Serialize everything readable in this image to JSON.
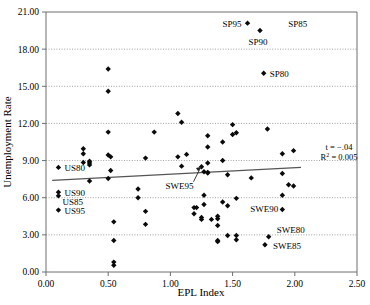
{
  "chart_data": {
    "type": "scatter",
    "title": "",
    "xlabel": "EPL Index",
    "ylabel": "Unemployment Rate",
    "xlim": [
      0.0,
      2.5
    ],
    "ylim": [
      0.0,
      21.0
    ],
    "xticks": [
      "0.00",
      "0.50",
      "1.00",
      "1.50",
      "2.00",
      "2.50"
    ],
    "xtick_values": [
      0.0,
      0.5,
      1.0,
      1.5,
      2.0,
      2.5
    ],
    "yticks": [
      "0.00",
      "3.00",
      "6.00",
      "9.00",
      "12.00",
      "15.00",
      "18.00",
      "21.00"
    ],
    "ytick_values": [
      0,
      3,
      6,
      9,
      12,
      15,
      18,
      21
    ],
    "grid": "horizontal-dotted",
    "legend": "none",
    "marker": "diamond",
    "marker_color": "#0a0a0a",
    "points": [
      [
        0.1,
        8.45
      ],
      [
        0.1,
        6.45
      ],
      [
        0.1,
        6.15
      ],
      [
        0.1,
        5.0
      ],
      [
        0.3,
        9.95
      ],
      [
        0.3,
        9.55
      ],
      [
        0.3,
        8.85
      ],
      [
        0.35,
        8.95
      ],
      [
        0.35,
        8.8
      ],
      [
        0.35,
        8.65
      ],
      [
        0.35,
        7.35
      ],
      [
        0.5,
        16.4
      ],
      [
        0.5,
        14.6
      ],
      [
        0.5,
        11.3
      ],
      [
        0.5,
        9.45
      ],
      [
        0.5,
        7.55
      ],
      [
        0.52,
        9.3
      ],
      [
        0.52,
        8.2
      ],
      [
        0.545,
        4.05
      ],
      [
        0.545,
        2.55
      ],
      [
        0.545,
        0.8
      ],
      [
        0.545,
        0.55
      ],
      [
        0.74,
        6.0
      ],
      [
        0.74,
        6.7
      ],
      [
        0.8,
        9.2
      ],
      [
        0.8,
        4.9
      ],
      [
        0.8,
        3.85
      ],
      [
        0.87,
        11.3
      ],
      [
        1.06,
        12.8
      ],
      [
        1.06,
        9.3
      ],
      [
        1.09,
        12.1
      ],
      [
        1.09,
        8.55
      ],
      [
        1.13,
        9.5
      ],
      [
        1.19,
        4.7
      ],
      [
        1.19,
        5.2
      ],
      [
        1.21,
        5.2
      ],
      [
        1.25,
        8.5
      ],
      [
        1.25,
        4.4
      ],
      [
        1.25,
        4.25
      ],
      [
        1.27,
        8.1
      ],
      [
        1.27,
        6.2
      ],
      [
        1.27,
        5.45
      ],
      [
        1.3,
        11.0
      ],
      [
        1.3,
        10.1
      ],
      [
        1.3,
        8.8
      ],
      [
        1.3,
        8.05
      ],
      [
        1.3,
        8.0
      ],
      [
        1.33,
        4.25
      ],
      [
        1.38,
        4.5
      ],
      [
        1.38,
        4.3
      ],
      [
        1.38,
        3.75
      ],
      [
        1.38,
        2.55
      ],
      [
        1.38,
        2.45
      ],
      [
        1.42,
        10.5
      ],
      [
        1.42,
        9.0
      ],
      [
        1.42,
        5.65
      ],
      [
        1.46,
        7.85
      ],
      [
        1.46,
        5.35
      ],
      [
        1.46,
        2.95
      ],
      [
        1.5,
        11.9
      ],
      [
        1.5,
        11.1
      ],
      [
        1.53,
        11.25
      ],
      [
        1.53,
        5.95
      ],
      [
        1.53,
        2.95
      ],
      [
        1.53,
        2.6
      ],
      [
        1.62,
        20.1
      ],
      [
        1.65,
        7.6
      ],
      [
        1.72,
        19.5
      ],
      [
        1.75,
        16.05
      ],
      [
        1.78,
        11.55
      ],
      [
        1.79,
        2.85
      ],
      [
        1.76,
        2.2
      ],
      [
        1.9,
        9.55
      ],
      [
        1.9,
        7.95
      ],
      [
        1.9,
        6.2
      ],
      [
        1.9,
        5.05
      ],
      [
        1.95,
        7.05
      ],
      [
        1.99,
        9.8
      ],
      [
        1.99,
        6.95
      ]
    ],
    "annotations": [
      {
        "label": "US80",
        "px": 0.1,
        "py": 8.45,
        "dx": 6,
        "dy": 3.5,
        "anchor": "start",
        "leader": false
      },
      {
        "label": "US90",
        "px": 0.1,
        "py": 6.45,
        "dx": 6,
        "dy": 3.5,
        "anchor": "start",
        "leader": false
      },
      {
        "label": "US85",
        "px": 0.1,
        "py": 6.15,
        "dx": 4,
        "dy": 9.0,
        "anchor": "start",
        "leader": false
      },
      {
        "label": "US95",
        "px": 0.1,
        "py": 5.0,
        "dx": 6,
        "dy": 3.5,
        "anchor": "start",
        "leader": false
      },
      {
        "label": "SP95",
        "px": 1.62,
        "py": 20.1,
        "dx": -6,
        "dy": 3.5,
        "anchor": "end",
        "leader": false
      },
      {
        "label": "SP90",
        "px": 1.72,
        "py": 19.5,
        "dx": -2,
        "dy": 14,
        "anchor": "middle",
        "leader": false
      },
      {
        "label": "SP85",
        "px": 1.9,
        "py": 20.1,
        "dx": 6,
        "dy": 3.5,
        "anchor": "start",
        "leader": false
      },
      {
        "label": "SP80",
        "px": 1.75,
        "py": 16.05,
        "dx": 6,
        "dy": 3.5,
        "anchor": "start",
        "leader": false
      },
      {
        "label": "SWE95",
        "px": 1.25,
        "py": 8.5,
        "dx": -22,
        "dy": 22,
        "anchor": "middle",
        "leader": true
      },
      {
        "label": "SWE90",
        "px": 1.53,
        "py": 5.35,
        "dx": 14,
        "dy": 6,
        "anchor": "start",
        "leader": false
      },
      {
        "label": "SWE80",
        "px": 1.79,
        "py": 2.85,
        "dx": 8,
        "dy": -4,
        "anchor": "start",
        "leader": false
      },
      {
        "label": "SWE85",
        "px": 1.76,
        "py": 2.2,
        "dx": 8,
        "dy": 4,
        "anchor": "start",
        "leader": false
      }
    ],
    "trendline": {
      "x0": 0.05,
      "y0": 7.4,
      "x1": 2.05,
      "y1": 8.45,
      "color": "#555555"
    },
    "stats": {
      "t_label": "t = −.04",
      "r2_prefix": "R",
      "r2_sup": "2",
      "r2_value": " = 0.005"
    }
  }
}
